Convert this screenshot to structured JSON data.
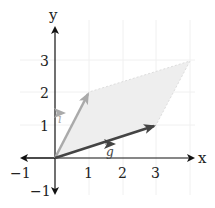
{
  "diagram": {
    "type": "vector-parallelogram",
    "axes": {
      "x_label": "x",
      "y_label": "y",
      "x_ticks": [
        "−1",
        "1",
        "2",
        "3"
      ],
      "y_ticks": [
        "3",
        "2",
        "1",
        "−1"
      ]
    },
    "vectors": [
      {
        "name": "i",
        "label": "i",
        "from": [
          0,
          0
        ],
        "to": [
          1,
          2
        ],
        "color": "#aaaaaa"
      },
      {
        "name": "g",
        "label": "g",
        "from": [
          0,
          0
        ],
        "to": [
          3,
          1
        ],
        "color": "#444444"
      }
    ],
    "parallelogram": {
      "vertices": [
        [
          0,
          0
        ],
        [
          1,
          2
        ],
        [
          4,
          3
        ],
        [
          3,
          1
        ]
      ],
      "fill": "#eeeeee",
      "edge_style": "dotted"
    },
    "colors": {
      "axis": "#111111",
      "grid": "#f0f0f0"
    }
  }
}
